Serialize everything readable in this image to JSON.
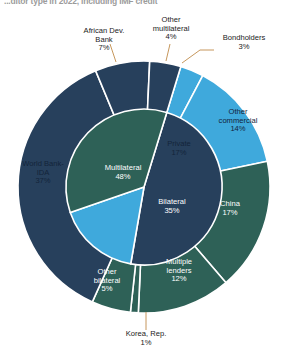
{
  "title": "...ditor type in 2022, including IMF credit",
  "chart_data": {
    "type": "pie",
    "title": "...ditor type in 2022, including IMF credit",
    "xlabel": "",
    "ylabel": "",
    "grid": false,
    "legend_position": "none",
    "note": "Nested donut: inner ring = creditor class, outer ring = individual creditor",
    "colors": {
      "multilateral": "#27405c",
      "private": "#3fa9dc",
      "bilateral": "#2e6157",
      "leader_line": "#c08b4a",
      "separator": "#ffffff",
      "label_dark": "#1b1b1b",
      "label_light": "#ffffff",
      "background": "#ffffff"
    },
    "inner_ring": {
      "name": "Creditor class",
      "categories": [
        "Multilateral",
        "Private",
        "Bilateral"
      ],
      "values": [
        48,
        17,
        35
      ],
      "labels": [
        "Multilateral\n48%",
        "Private\n17%",
        "Bilateral\n35%"
      ]
    },
    "outer_ring": {
      "name": "Creditor",
      "categories": [
        "World Bank-IDA",
        "African Dev. Bank",
        "Other multilateral",
        "Bondholders",
        "Other commercial",
        "China",
        "Multiple lenders",
        "Korea, Rep.",
        "Other bilateral"
      ],
      "values": [
        37,
        7,
        4,
        3,
        14,
        17,
        12,
        1,
        5
      ],
      "groups": [
        "Multilateral",
        "Multilateral",
        "Multilateral",
        "Private",
        "Private",
        "Bilateral",
        "Bilateral",
        "Bilateral",
        "Bilateral"
      ]
    },
    "slices": [
      {
        "label": "World Bank-IDA",
        "value": 37,
        "pct_text": "37%",
        "group": "Multilateral",
        "color": "#27405c",
        "label_placement": "inside"
      },
      {
        "label": "African Dev. Bank",
        "value": 7,
        "pct_text": "7%",
        "group": "Multilateral",
        "color": "#27405c",
        "label_placement": "callout"
      },
      {
        "label": "Other multilateral",
        "value": 4,
        "pct_text": "4%",
        "group": "Multilateral",
        "color": "#27405c",
        "label_placement": "callout"
      },
      {
        "label": "Bondholders",
        "value": 3,
        "pct_text": "3%",
        "group": "Private",
        "color": "#3fa9dc",
        "label_placement": "callout"
      },
      {
        "label": "Other commercial",
        "value": 14,
        "pct_text": "14%",
        "group": "Private",
        "color": "#3fa9dc",
        "label_placement": "inside"
      },
      {
        "label": "China",
        "value": 17,
        "pct_text": "17%",
        "group": "Bilateral",
        "color": "#2e6157",
        "label_placement": "inside"
      },
      {
        "label": "Multiple lenders",
        "value": 12,
        "pct_text": "12%",
        "group": "Bilateral",
        "color": "#2e6157",
        "label_placement": "inside"
      },
      {
        "label": "Korea, Rep.",
        "value": 1,
        "pct_text": "1%",
        "group": "Bilateral",
        "color": "#2e6157",
        "label_placement": "callout"
      },
      {
        "label": "Other bilateral",
        "value": 5,
        "pct_text": "5%",
        "group": "Bilateral",
        "color": "#2e6157",
        "label_placement": "inside"
      }
    ]
  },
  "labels": {
    "world_bank_ida": "World Bank-\nIDA\n37%",
    "african_dev_bank": "African Dev.\nBank\n7%",
    "other_multilateral": "Other\nmultilateral\n4%",
    "bondholders": "Bondholders\n3%",
    "other_commercial": "Other\ncommercial\n14%",
    "china": "China\n17%",
    "multiple_lenders": "Multiple\nlenders\n12%",
    "korea_rep": "Korea, Rep.\n1%",
    "other_bilateral": "Other\nbilateral\n5%",
    "multilateral": "Multilateral\n48%",
    "private": "Private\n17%",
    "bilateral": "Bilateral\n35%"
  }
}
